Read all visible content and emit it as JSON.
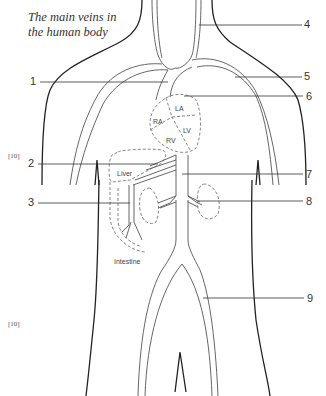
{
  "diagram": {
    "title_line1": "The main veins in",
    "title_line2": "the human body",
    "markers": [
      "[10]",
      "[10]"
    ],
    "callouts": [
      {
        "n": "1",
        "side": "left"
      },
      {
        "n": "2",
        "side": "left"
      },
      {
        "n": "3",
        "side": "left"
      },
      {
        "n": "4",
        "side": "right"
      },
      {
        "n": "5",
        "side": "right"
      },
      {
        "n": "6",
        "side": "right"
      },
      {
        "n": "7",
        "side": "right"
      },
      {
        "n": "8",
        "side": "right"
      },
      {
        "n": "9",
        "side": "right"
      }
    ],
    "organ_labels": {
      "la": "LA",
      "ra": "RA",
      "lv": "LV",
      "rv": "RV",
      "liver": "Liver",
      "intestine": "Intestine"
    },
    "colors": {
      "body_outline": "#222222",
      "vein_line": "#555555",
      "dashed": "#666666",
      "leader": "#333333"
    }
  }
}
